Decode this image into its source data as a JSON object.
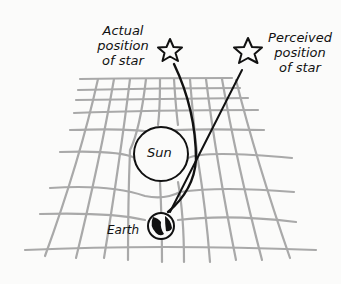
{
  "labels": {
    "actual_line1": "Actual",
    "actual_line2": "position",
    "actual_line3": "of star",
    "perceived_line1": "Perceived",
    "perceived_line2": "position",
    "perceived_line3": "of star",
    "sun": "Sun",
    "earth": "Earth"
  },
  "colors": {
    "background": "#fbfbfa",
    "grid": "#a9a9a9",
    "ink": "#111111"
  }
}
